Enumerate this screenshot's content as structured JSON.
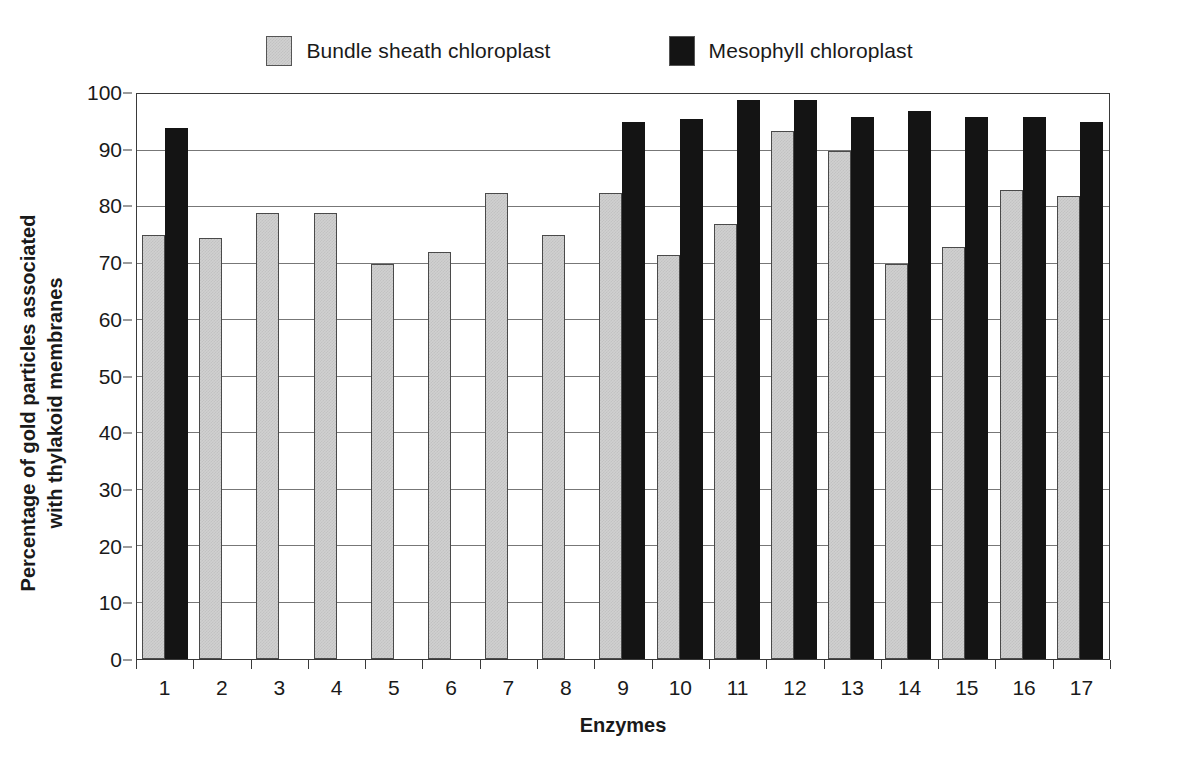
{
  "chart_data": {
    "type": "bar",
    "title": "",
    "xlabel": "Enzymes",
    "ylabel": "Percentage of gold particles associated with thylakoid membranes",
    "categories": [
      "1",
      "2",
      "3",
      "4",
      "5",
      "6",
      "7",
      "8",
      "9",
      "10",
      "11",
      "12",
      "13",
      "14",
      "15",
      "16",
      "17"
    ],
    "ylim": [
      0,
      100
    ],
    "yticks": [
      0,
      10,
      20,
      30,
      40,
      50,
      60,
      70,
      80,
      90,
      100
    ],
    "grid": true,
    "legend_position": "top",
    "series": [
      {
        "name": "Bundle sheath chloroplast",
        "color": "#d0d0d0",
        "values": [
          75,
          74.5,
          79,
          79,
          70,
          72,
          82.5,
          75,
          82.5,
          71.5,
          77,
          93.5,
          90,
          70,
          73,
          83,
          82
        ]
      },
      {
        "name": "Mesophyll chloroplast",
        "color": "#141414",
        "values": [
          94,
          null,
          null,
          null,
          null,
          null,
          null,
          null,
          95,
          95.5,
          99,
          99,
          96,
          97,
          96,
          96,
          95
        ]
      }
    ]
  },
  "legend": {
    "entries": [
      {
        "label": "Bundle sheath chloroplast",
        "swatch": "grey-swatch-icon"
      },
      {
        "label": "Mesophyll chloroplast",
        "swatch": "black-swatch-icon"
      }
    ]
  },
  "axes": {
    "y_title": "Percentage of gold particles associated with thylakoid membranes",
    "y_title_line1": "Percentage of gold particles associated",
    "y_title_line2": "with thylakoid membranes",
    "x_title": "Enzymes"
  }
}
